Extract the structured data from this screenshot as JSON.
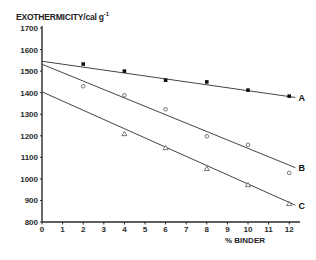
{
  "chart_data": {
    "type": "line",
    "title": "",
    "ylabel": "EXOTHERMICITY / cal g⁻¹",
    "ylabel_main": "EXOTHERMICITY/cal g",
    "ylabel_sup": "-1",
    "xlabel": "% BINDER",
    "xlim": [
      0,
      12
    ],
    "ylim": [
      800,
      1700
    ],
    "x_ticks": [
      0,
      1,
      2,
      3,
      4,
      5,
      6,
      7,
      8,
      9,
      10,
      11,
      12
    ],
    "y_ticks": [
      800,
      900,
      1000,
      1100,
      1200,
      1300,
      1400,
      1500,
      1600,
      1700
    ],
    "grid": false,
    "legend": "inline labels at line ends",
    "series": [
      {
        "name": "A",
        "marker": "filled-square",
        "x": [
          2,
          4,
          6,
          8,
          10,
          12
        ],
        "values": [
          1533,
          1500,
          1458,
          1450,
          1412,
          1384
        ],
        "fit_line": {
          "x": [
            0,
            12.3
          ],
          "y": [
            1546,
            1378
          ]
        }
      },
      {
        "name": "B",
        "marker": "open-circle",
        "x": [
          2,
          4,
          6,
          8,
          10,
          12
        ],
        "values": [
          1430,
          1388,
          1323,
          1198,
          1158,
          1028
        ],
        "fit_line": {
          "x": [
            0,
            12.3
          ],
          "y": [
            1532,
            1052
          ]
        }
      },
      {
        "name": "C",
        "marker": "open-triangle",
        "x": [
          4,
          6,
          8,
          10,
          12
        ],
        "values": [
          1209,
          1144,
          1047,
          972,
          884
        ],
        "fit_line": {
          "x": [
            0,
            12.3
          ],
          "y": [
            1404,
            878
          ]
        }
      }
    ]
  }
}
